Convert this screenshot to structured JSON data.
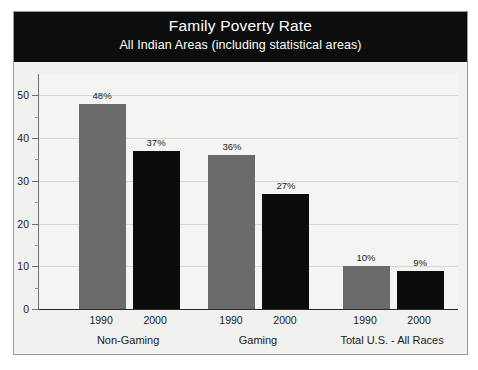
{
  "chart_data": {
    "type": "bar",
    "title": "Family Poverty Rate",
    "subtitle": "All Indian Areas (including statistical areas)",
    "xlabel": "",
    "ylabel": "",
    "ylim": [
      0,
      55
    ],
    "yticks": [
      0,
      10,
      20,
      30,
      40,
      50
    ],
    "ytick_labels": [
      "0",
      "10",
      "20",
      "30",
      "40",
      "50"
    ],
    "grid": true,
    "legend": "none",
    "categories": [
      "Non-Gaming",
      "Gaming",
      "Total U.S. - All Races"
    ],
    "subcategories": [
      "1990",
      "2000"
    ],
    "series": [
      {
        "name": "1990",
        "color": "#6b6b6b",
        "values": [
          48,
          36,
          10
        ],
        "labels": [
          "48%",
          "36%",
          "10%"
        ]
      },
      {
        "name": "2000",
        "color": "#0c0c0c",
        "values": [
          37,
          27,
          9
        ],
        "labels": [
          "37%",
          "27%",
          "9%"
        ]
      }
    ],
    "bars": [
      {
        "group": "Non-Gaming",
        "year": "1990",
        "value": 48,
        "label": "48%",
        "color": "#6b6b6b"
      },
      {
        "group": "Non-Gaming",
        "year": "2000",
        "value": 37,
        "label": "37%",
        "color": "#0c0c0c"
      },
      {
        "group": "Gaming",
        "year": "1990",
        "value": 36,
        "label": "36%",
        "color": "#6b6b6b"
      },
      {
        "group": "Gaming",
        "year": "2000",
        "value": 27,
        "label": "27%",
        "color": "#0c0c0c"
      },
      {
        "group": "Total U.S. - All Races",
        "year": "1990",
        "value": 10,
        "label": "10%",
        "color": "#6b6b6b"
      },
      {
        "group": "Total U.S. - All Races",
        "year": "2000",
        "value": 9,
        "label": "9%",
        "color": "#0c0c0c"
      }
    ]
  },
  "colors": {
    "title_band_bg": "#0d0d0d",
    "title_band_text": "#ffffff",
    "plot_bg": "#f4f4f2",
    "frame_border": "#9a9a9a",
    "gridline": "#d7d7d4",
    "axis": "#2a2a2a",
    "series_1990": "#6b6b6b",
    "series_2000": "#0c0c0c"
  }
}
